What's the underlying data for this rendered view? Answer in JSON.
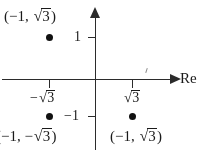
{
  "figure": {
    "background_color": "#ffffff",
    "ink_color": "#1a1a1a"
  },
  "axes": {
    "real": {
      "name": "Re",
      "arrow": "arrow-right",
      "ticks": [
        {
          "id": "neg-sqrt3",
          "label_prefix": "−",
          "radicand": "3",
          "value": "-√3"
        },
        {
          "id": "pos-sqrt3",
          "label_prefix": "",
          "radicand": "3",
          "value": "√3"
        }
      ]
    },
    "imaginary": {
      "name": "",
      "arrow": "arrow-up",
      "ticks": [
        {
          "id": "im-1",
          "label": "1",
          "value": 1
        },
        {
          "id": "im-neg1",
          "label": "−1",
          "value": -1
        }
      ]
    }
  },
  "points": [
    {
      "id": "upper-left",
      "label_open": "(−1, ",
      "label_radicand": "3",
      "label_close": ")",
      "full_label": "(−1, √3)",
      "x": -1,
      "y": "√3"
    },
    {
      "id": "lower-left",
      "label_open": "(−1, −",
      "label_radicand": "3",
      "label_close": ")",
      "full_label": "(−1, −√3)",
      "x": -1,
      "y": "-√3"
    },
    {
      "id": "lower-right",
      "label_open": "(−1, ",
      "label_radicand": "3",
      "label_close": ")",
      "full_label": "(−1, √3)",
      "x": "√3",
      "y": "-√3"
    }
  ],
  "tick_labels": {
    "im_one": "1",
    "im_neg_one": "−1",
    "re_neg_sqrt3_prefix": "−",
    "re_neg_sqrt3_radicand": "3",
    "re_pos_sqrt3_prefix": "",
    "re_pos_sqrt3_radicand": "3",
    "radical_sign": "√"
  },
  "chart_data": {
    "type": "scatter",
    "title": "",
    "xlabel": "Re",
    "ylabel": "",
    "xlim": [
      -2.6,
      2.4
    ],
    "ylim": [
      -2.2,
      1.9
    ],
    "grid": false,
    "legend": null,
    "x_ticks": [
      {
        "position": -1.732,
        "label": "−√3"
      },
      {
        "position": 1.732,
        "label": "√3"
      }
    ],
    "y_ticks": [
      {
        "position": 1,
        "label": "1"
      },
      {
        "position": -1,
        "label": "−1"
      }
    ],
    "points": [
      {
        "x": -1.732,
        "y": 1.45,
        "label": "(−1, √3)",
        "label_position": "above-left"
      },
      {
        "x": -1.732,
        "y": -1.0,
        "label": "(−1, −√3)",
        "label_position": "below"
      },
      {
        "x": 1.732,
        "y": -1.0,
        "label": "(−1, √3)",
        "label_position": "below"
      }
    ]
  }
}
